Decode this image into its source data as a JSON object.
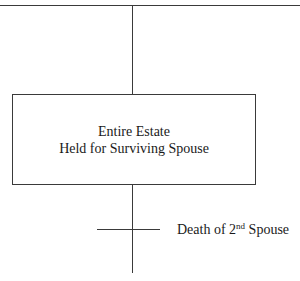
{
  "diagram": {
    "box": {
      "line1": "Entire Estate",
      "line2": "Held for Surviving Spouse"
    },
    "event_label": {
      "prefix": "Death of 2",
      "superscript": "nd",
      "suffix": " Spouse"
    },
    "colors": {
      "line": "#3a3a3a",
      "text": "#1a1a1a",
      "background": "#ffffff"
    }
  }
}
